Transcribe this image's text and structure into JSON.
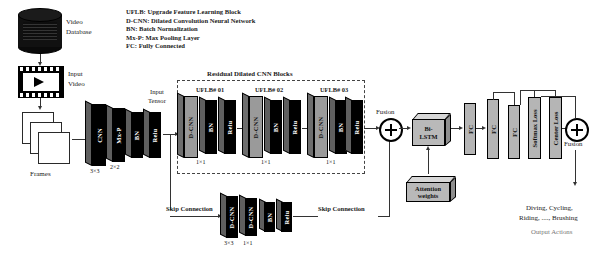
{
  "legend": {
    "lines": [
      "UFLB: Upgrade Feature Learning Block",
      "D-CNN: Dilated Convolution Neural Network",
      "BN: Batch Normalization",
      "Mx-P: Max Pooling Layer",
      "FC: Fully Connected"
    ]
  },
  "input": {
    "database_label_line1": "Video",
    "database_label_line2": "Database",
    "video_label_line1": "Input",
    "video_label_line2": "Video",
    "frames_label": "Frames"
  },
  "stem": {
    "blocks": [
      {
        "name": "CNN",
        "kernel": "3×3"
      },
      {
        "name": "Mx-P",
        "kernel": "2×2"
      },
      {
        "name": "BN",
        "kernel": ""
      },
      {
        "name": "Relu",
        "kernel": ""
      }
    ],
    "tensor_label_line1": "Input",
    "tensor_label_line2": "Tensor"
  },
  "residual": {
    "group_title": "Residual Dilated CNN Blocks",
    "blocks": [
      {
        "title": "UFLB# 01",
        "layers": [
          "D-CNN",
          "BN",
          "Relu"
        ],
        "kernel": "1×1"
      },
      {
        "title": "UFLB# 02",
        "layers": [
          "D-CNN",
          "BN",
          "Relu"
        ],
        "kernel": "1×1"
      },
      {
        "title": "UFLB# 03",
        "layers": [
          "D-CNN",
          "BN",
          "Relu"
        ],
        "kernel": "1×1"
      }
    ]
  },
  "skip": {
    "label_left": "Skip Connection",
    "label_right": "Skip Connection",
    "blocks": [
      {
        "name": "D-CNN",
        "kernel": "3×3"
      },
      {
        "name": "D-CNN",
        "kernel": "1×1"
      },
      {
        "name": "BN",
        "kernel": ""
      },
      {
        "name": "Relu",
        "kernel": ""
      }
    ]
  },
  "fusion": {
    "first_label": "Fusion",
    "second_label": "Fusion"
  },
  "sequence": {
    "bilstm_line1": "Bi-",
    "bilstm_line2": "LSTM",
    "attention_line1": "Attention",
    "attention_line2": "weights"
  },
  "head": {
    "fc1": "FC",
    "fc2": "FC",
    "fc3": "FC",
    "softmax_loss": "Softmax Loss",
    "center_loss": "Center Loss"
  },
  "output": {
    "actions_line1": "Diving, Cycling,",
    "actions_line2": "Riding, ...., Brushing",
    "caption": "Output Actions"
  }
}
